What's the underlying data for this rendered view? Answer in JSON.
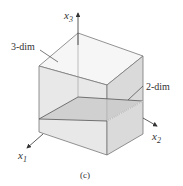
{
  "figure": {
    "caption": "(c)",
    "labels": {
      "x1_base": "x",
      "x1_sub": "1",
      "x2_base": "x",
      "x2_sub": "2",
      "x3_base": "x",
      "x3_sub": "3",
      "volume": "3-dim",
      "plane": "2-dim"
    },
    "colors": {
      "edge": "#6e6e6e",
      "plane_edge": "#555555",
      "top_face": "#f5f5f5",
      "left_face": "#e6e6e6",
      "right_face": "#d9d9d9",
      "plane_fill": "#c9c9c9",
      "axis": "#333333"
    }
  }
}
